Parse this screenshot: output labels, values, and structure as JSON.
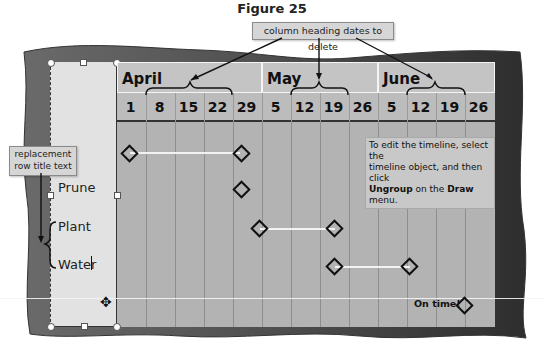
{
  "figure": {
    "title": "Figure 25"
  },
  "callouts": {
    "column_headings": "column heading dates to delete",
    "row_titles": "replacement row title text"
  },
  "timeline": {
    "months": [
      {
        "label": "April",
        "selected": true
      },
      {
        "label": "May",
        "selected": true
      },
      {
        "label": "June",
        "selected": true
      }
    ],
    "dates": [
      "1",
      "8",
      "15",
      "22",
      "29",
      "5",
      "12",
      "19",
      "26",
      "5",
      "12",
      "19",
      "26"
    ],
    "rows": [
      {
        "label": "",
        "start": "April 1",
        "end": "April 29"
      },
      {
        "label": "Prune",
        "start": "April 29",
        "end": "April 29"
      },
      {
        "label": "Plant",
        "start": "May 5",
        "end": "May 19"
      },
      {
        "label": "Water",
        "start": "May 19",
        "end": "June 12"
      }
    ],
    "legend": {
      "label": "On time!",
      "icon": "diamond-icon"
    }
  },
  "note": {
    "line1": "To edit the timeline, select the",
    "line2": "timeline object, and then click",
    "bold1": "Ungroup",
    "mid": " on the ",
    "bold2": "Draw",
    "end": " menu."
  },
  "colors": {
    "frame": "#4a4a4a",
    "slide": "#b3b3b3",
    "row_title_box": "#e2e2e2",
    "callout": "#d6d6d6",
    "task_bar": "#f2f2f2"
  }
}
